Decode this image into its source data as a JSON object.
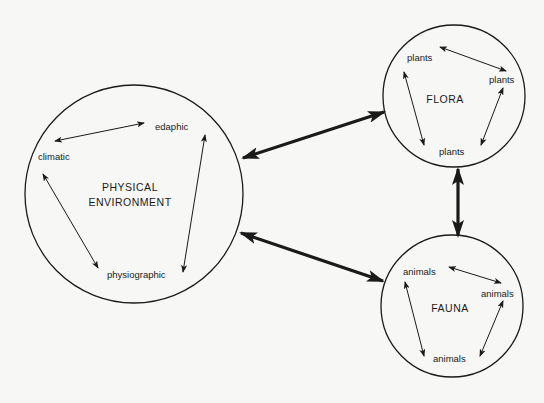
{
  "diagram": {
    "colors": {
      "background": "#f7f7f5",
      "stroke": "#1a1a1a"
    },
    "nodes": {
      "physical": {
        "title_line1": "PHYSICAL",
        "title_line2": "ENVIRONMENT",
        "factors": [
          "edaphic",
          "climatic",
          "physiographic"
        ]
      },
      "flora": {
        "title": "FLORA",
        "members": [
          "plants",
          "plants",
          "plants"
        ]
      },
      "fauna": {
        "title": "FAUNA",
        "members": [
          "animals",
          "animals",
          "animals"
        ]
      }
    },
    "connections": [
      {
        "from": "physical",
        "to": "flora",
        "type": "bidirectional-bold"
      },
      {
        "from": "physical",
        "to": "fauna",
        "type": "bidirectional-bold"
      },
      {
        "from": "flora",
        "to": "fauna",
        "type": "bidirectional-bold"
      }
    ]
  }
}
